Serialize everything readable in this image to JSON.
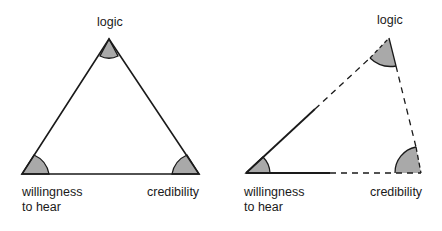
{
  "diagrams": [
    {
      "id": "complete",
      "vertices": {
        "top": {
          "label": "logic"
        },
        "bottom_left": {
          "label": "willingness to hear",
          "lines": [
            "willingness",
            "to hear"
          ]
        },
        "bottom_right": {
          "label": "credibility"
        }
      },
      "edges": "all solid"
    },
    {
      "id": "broken",
      "vertices": {
        "top": {
          "label": "logic"
        },
        "bottom_left": {
          "label": "willingness to hear",
          "lines": [
            "willingness",
            "to hear"
          ]
        },
        "bottom_right": {
          "label": "credibility"
        }
      },
      "edges": "partially solid, remainder dashed"
    }
  ],
  "colors": {
    "line": "#1a1a1a",
    "angle_fill": "#a9a9a9",
    "background": "#ffffff"
  }
}
